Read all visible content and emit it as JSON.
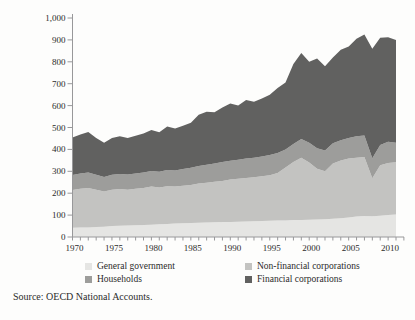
{
  "chart_data": {
    "type": "area",
    "stacked": true,
    "title": "",
    "xlabel": "",
    "ylabel": "",
    "ylim": [
      0,
      1000
    ],
    "ytick_step": 100,
    "grid": false,
    "legend_position": "bottom",
    "x": [
      1970,
      1971,
      1972,
      1973,
      1974,
      1975,
      1976,
      1977,
      1978,
      1979,
      1980,
      1981,
      1982,
      1983,
      1984,
      1985,
      1986,
      1987,
      1988,
      1989,
      1990,
      1991,
      1992,
      1993,
      1994,
      1995,
      1996,
      1997,
      1998,
      1999,
      2000,
      2001,
      2002,
      2003,
      2004,
      2005,
      2006,
      2007,
      2008,
      2009,
      2010,
      2011
    ],
    "series": [
      {
        "name": "General government",
        "color": "#e5e5e3",
        "values": [
          42,
          43,
          44,
          45,
          47,
          50,
          51,
          52,
          54,
          55,
          56,
          58,
          60,
          62,
          63,
          64,
          65,
          66,
          67,
          68,
          69,
          70,
          71,
          72,
          73,
          74,
          75,
          76,
          77,
          78,
          79,
          80,
          81,
          83,
          86,
          89,
          93,
          96,
          95,
          97,
          100,
          103
        ]
      },
      {
        "name": "Non-financial corporations",
        "color": "#c3c3c1",
        "values": [
          173,
          177,
          180,
          171,
          161,
          166,
          168,
          164,
          166,
          169,
          174,
          168,
          172,
          168,
          171,
          174,
          179,
          182,
          185,
          188,
          193,
          196,
          199,
          201,
          204,
          208,
          217,
          242,
          265,
          284,
          261,
          232,
          219,
          252,
          264,
          269,
          269,
          269,
          173,
          231,
          238,
          238
        ]
      },
      {
        "name": "Households",
        "color": "#9d9d9b",
        "values": [
          68,
          70,
          70,
          68,
          66,
          68,
          69,
          69,
          70,
          71,
          72,
          72,
          74,
          74,
          76,
          78,
          80,
          82,
          83,
          86,
          86,
          87,
          88,
          89,
          91,
          93,
          91,
          82,
          83,
          86,
          90,
          93,
          95,
          93,
          92,
          94,
          98,
          99,
          92,
          92,
          97,
          89
        ]
      },
      {
        "name": "Financial corporations",
        "color": "#616160",
        "values": [
          172,
          178,
          186,
          168,
          156,
          168,
          172,
          167,
          172,
          177,
          186,
          180,
          199,
          191,
          198,
          206,
          234,
          242,
          235,
          250,
          262,
          247,
          267,
          256,
          264,
          275,
          297,
          305,
          365,
          392,
          370,
          410,
          385,
          392,
          413,
          418,
          445,
          461,
          500,
          490,
          477,
          470
        ]
      }
    ],
    "ytick_labels": [
      "0",
      "100",
      "200",
      "300",
      "400",
      "500",
      "600",
      "700",
      "800",
      "900",
      "1,000"
    ],
    "xtick_labels": [
      "1970",
      "1975",
      "1980",
      "1985",
      "1990",
      "1995",
      "2000",
      "2005",
      "2010"
    ]
  },
  "source": {
    "text": "Source: OECD National Accounts."
  }
}
